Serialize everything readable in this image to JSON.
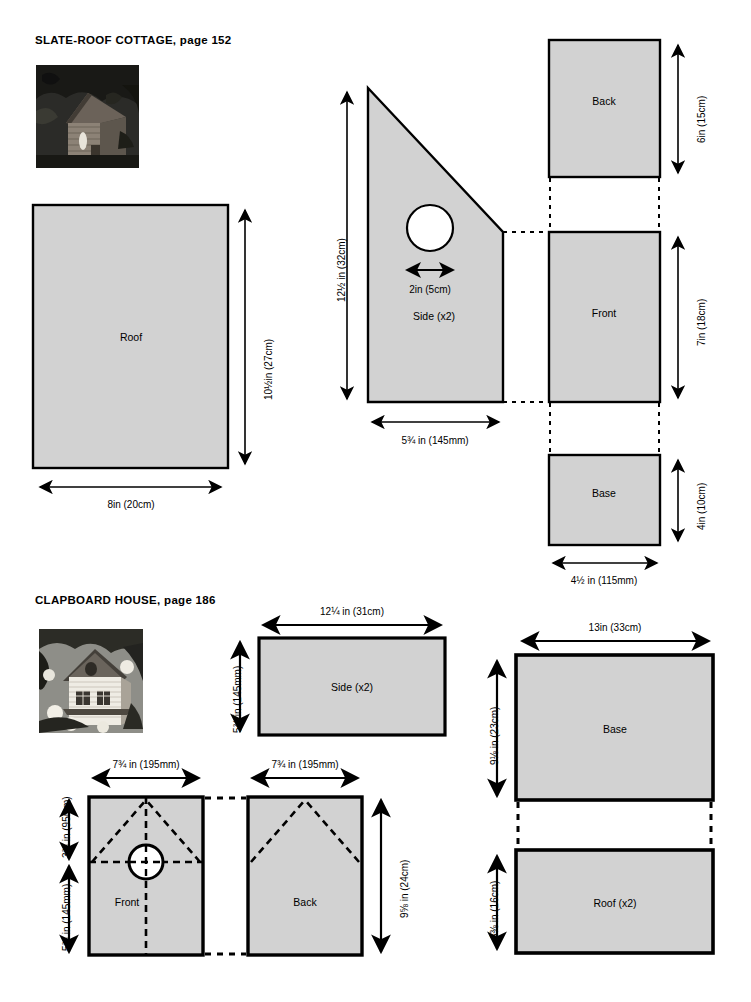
{
  "document": {
    "type": "birdhouse-cutting-plans",
    "background_color": "#ffffff",
    "panel_fill_color": "#d2d2d2",
    "panel_stroke_color": "#000000",
    "dimension_line_color": "#000000"
  },
  "sections": [
    {
      "id": "slate-roof-cottage",
      "title_name": "SLATE-ROOF COTTAGE,",
      "title_page": "page 152",
      "photo_caption": "slate-roof-cottage-photo",
      "parts": [
        {
          "id": "roof",
          "label": "Roof",
          "shape": "rectangle",
          "width_label": "8in (20cm)",
          "height_label": "10½in (27cm)"
        },
        {
          "id": "side",
          "label": "Side (x2)",
          "shape": "pentagon-sloped",
          "width_label": "5¾iin (145mm)",
          "width_label_text": "5¾iin (145mm)",
          "height_label": "12½in (32cm)",
          "hole_label": "2in (5cm)",
          "has_entry_hole": true
        },
        {
          "id": "back",
          "label": "Back",
          "shape": "rectangle",
          "height_label": "6in (15cm)"
        },
        {
          "id": "front",
          "label": "Front",
          "shape": "rectangle",
          "height_label": "7in (18cm)"
        },
        {
          "id": "base",
          "label": "Base",
          "shape": "rectangle",
          "height_label": "4in (10cm)",
          "width_label": "4½in (115mm)"
        }
      ]
    },
    {
      "id": "clapboard-house",
      "title_name": "CLAPBOARD HOUSE,",
      "title_page": "page 186",
      "photo_caption": "clapboard-house-photo",
      "parts": [
        {
          "id": "side",
          "label": "Side (x2)",
          "shape": "rectangle",
          "width_label": "12¼in (31cm)",
          "height_label": "5¾iin (145mm)"
        },
        {
          "id": "front",
          "label": "Front",
          "shape": "rectangle",
          "width_label": "7¾iin (195mm)",
          "height_label_upper": "3¾iin (95mm)",
          "height_label_lower": "5¾iin (145mm)",
          "has_entry_hole": true,
          "has_gable_guides": true
        },
        {
          "id": "back",
          "label": "Back",
          "shape": "rectangle",
          "width_label": "7¾iin (195mm)",
          "height_label": "9⅝in (24cm)",
          "has_gable_guides": true
        },
        {
          "id": "base",
          "label": "Base",
          "shape": "rectangle",
          "width_label": "13in (33cm)",
          "height_label": "9⅛in (23cm)"
        },
        {
          "id": "roof",
          "label": "Roof (x2)",
          "shape": "rectangle",
          "height_label": "6⅜in (16cm)"
        }
      ]
    }
  ],
  "labels": {
    "s1_title_name": "SLATE-ROOF COTTAGE,",
    "s1_title_page": "page 152",
    "s1_roof_name": "Roof",
    "s1_roof_w": "8in (20cm)",
    "s1_roof_h": "10½in (27cm)",
    "s1_side_name": "Side (x2)",
    "s1_side_w": "5¾ in (145mm)",
    "s1_side_h": "12½ in (32cm)",
    "s1_side_hole": "2in (5cm)",
    "s1_back_name": "Back",
    "s1_back_h": "6in (15cm)",
    "s1_front_name": "Front",
    "s1_front_h": "7in (18cm)",
    "s1_base_name": "Base",
    "s1_base_h": "4in (10cm)",
    "s1_base_w": "4½ in (115mm)",
    "s2_title_name": "CLAPBOARD HOUSE,",
    "s2_title_page": "page 186",
    "s2_side_name": "Side (x2)",
    "s2_side_w": "12¼ in (31cm)",
    "s2_side_h": "5¾ in (145mm)",
    "s2_front_name": "Front",
    "s2_front_w": "7¾ in (195mm)",
    "s2_front_h_upper": "3¾ in (95mm)",
    "s2_front_h_lower": "5¾ in (145mm)",
    "s2_back_name": "Back",
    "s2_back_w": "7¾ in (195mm)",
    "s2_back_h": "9⅝ in (24cm)",
    "s2_base_name": "Base",
    "s2_base_w": "13in (33cm)",
    "s2_base_h": "9⅛ in (23cm)",
    "s2_roof_name": "Roof (x2)",
    "s2_roof_h": "6⅜ in (16cm)"
  }
}
